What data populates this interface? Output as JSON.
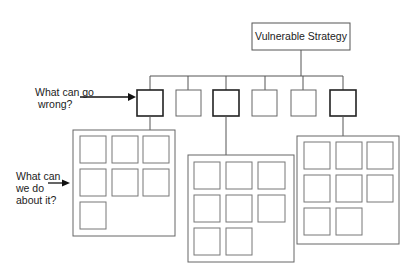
{
  "diagram": {
    "title": "Vulnerable Strategy",
    "question_1": {
      "line1": "What can go",
      "line2": "wrong?"
    },
    "question_2": {
      "line1": "What can",
      "line2": "we do",
      "line3": "about it?"
    },
    "risk_nodes": [
      {
        "id": 1,
        "emphasized": true
      },
      {
        "id": 2,
        "emphasized": false
      },
      {
        "id": 3,
        "emphasized": true
      },
      {
        "id": 4,
        "emphasized": false
      },
      {
        "id": 5,
        "emphasized": false
      },
      {
        "id": 6,
        "emphasized": true
      }
    ],
    "response_groups": [
      {
        "parent_node": 1,
        "item_count": 7
      },
      {
        "parent_node": 3,
        "item_count": 8
      },
      {
        "parent_node": 6,
        "item_count": 8
      }
    ],
    "colors": {
      "line": "#555555",
      "emphasis": "#222222",
      "background": "#ffffff"
    }
  }
}
